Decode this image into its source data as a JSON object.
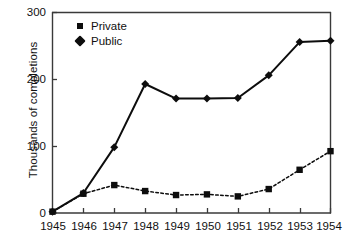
{
  "chart_data": {
    "type": "line",
    "title": "",
    "xlabel": "",
    "ylabel": "Thousands of completions",
    "x": [
      1945,
      1946,
      1947,
      1948,
      1949,
      1950,
      1951,
      1952,
      1953,
      1954
    ],
    "xtick_labels": [
      "1945",
      "1946",
      "1947",
      "1948",
      "1949",
      "1950",
      "1951",
      "1952",
      "1953",
      "1954"
    ],
    "ytick_labels": [
      "0",
      "100",
      "200",
      "300"
    ],
    "yticks": [
      0,
      100,
      200,
      300
    ],
    "ylim": [
      0,
      300
    ],
    "xlim": [
      1945,
      1954
    ],
    "grid": false,
    "legend_position": "upper-left-inside",
    "series": [
      {
        "name": "Private",
        "marker": "square",
        "linestyle": "dashed",
        "color": "#0d0d0d",
        "values": [
          2,
          29,
          42,
          33,
          27,
          28,
          25,
          36,
          65,
          93
        ]
      },
      {
        "name": "Public",
        "marker": "diamond",
        "linestyle": "solid",
        "color": "#0d0d0d",
        "values": [
          2,
          30,
          99,
          194,
          172,
          172,
          173,
          207,
          257,
          259
        ]
      }
    ]
  },
  "legend": {
    "items": [
      {
        "label": "Private",
        "marker": "square-marker"
      },
      {
        "label": "Public",
        "marker": "diamond-marker"
      }
    ]
  },
  "axes": {
    "y_title": "Thousands of completions"
  },
  "colors": {
    "ink": "#0d0d0d",
    "axis": "#3a3a3a",
    "background": "#ffffff"
  }
}
